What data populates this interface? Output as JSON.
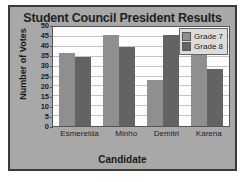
{
  "chart_data": {
    "type": "bar",
    "title": "Student Council President Results",
    "xlabel": "Candidate",
    "ylabel": "Number of Votes",
    "categories": [
      "Esmerelda",
      "Minho",
      "Demitri",
      "Karena"
    ],
    "series": [
      {
        "name": "Grade 7",
        "values": [
          37,
          46,
          23,
          38
        ],
        "color": "#8f8f8f"
      },
      {
        "name": "Grade 8",
        "values": [
          35,
          40,
          46,
          29
        ],
        "color": "#636363"
      }
    ],
    "ylim": [
      0,
      50
    ],
    "ytick_step": 5,
    "yticks": [
      50,
      45,
      40,
      35,
      30,
      25,
      20,
      15,
      10,
      5,
      0
    ],
    "grid": true,
    "legend_position": "top-right"
  },
  "figure": {
    "panel_color": "#a8a8a8",
    "border_color": "#3a3a3a",
    "plot_background": "#fdfdfd",
    "gridline_color": "#c4c4c4"
  }
}
